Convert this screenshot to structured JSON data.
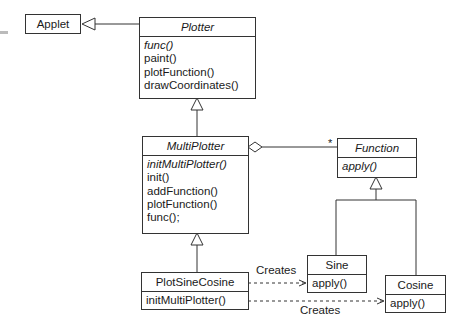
{
  "classes": {
    "applet": {
      "name": "Applet"
    },
    "plotter": {
      "name": "Plotter",
      "ops": [
        "func()",
        "paint()",
        "plotFunction()",
        "drawCoordinates()"
      ]
    },
    "multiplotter": {
      "name": "MultiPlotter",
      "ops": [
        "initMultiPlotter()",
        "init()",
        "addFunction()",
        "plotFunction()",
        "func();"
      ]
    },
    "function": {
      "name": "Function",
      "ops": [
        "apply()"
      ]
    },
    "sine": {
      "name": "Sine",
      "ops": [
        "apply()"
      ]
    },
    "cosine": {
      "name": "Cosine",
      "ops": [
        "apply()"
      ]
    },
    "plotsinecosine": {
      "name": "PlotSineCosine",
      "ops": [
        "initMultiPlotter()"
      ]
    }
  },
  "relations": {
    "multiplicity": "*",
    "creates_sine": "Creates",
    "creates_cosine": "Creates"
  }
}
